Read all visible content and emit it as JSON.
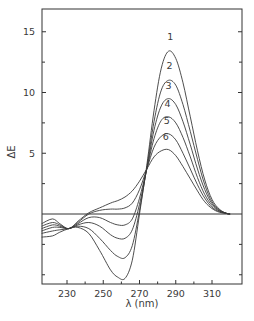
{
  "chart_data": {
    "type": "line",
    "title": "",
    "xlabel": "λ (nm)",
    "ylabel": "ΔE",
    "xlim": [
      216,
      326
    ],
    "ylim": [
      -6,
      17
    ],
    "x_ticks": [
      230,
      250,
      270,
      290,
      310
    ],
    "x_minor_ticks": [
      240,
      260,
      280,
      300
    ],
    "y_ticks": [
      5,
      10,
      15
    ],
    "y_minor_ticks": [
      -5,
      -2.5,
      2.5,
      7.5,
      12.5
    ],
    "grid": false,
    "legend": "inline numeric labels above peaks",
    "zero_line": true,
    "x": [
      216,
      222,
      226,
      231,
      236,
      242,
      248,
      254,
      258,
      262,
      266,
      270,
      274,
      278,
      282,
      286,
      290,
      294,
      298,
      302,
      306,
      310,
      314,
      318,
      320
    ],
    "series": [
      {
        "name": "1",
        "values": [
          -1.9,
          -1.8,
          -1.5,
          -1.2,
          -1.1,
          -1.6,
          -3.0,
          -4.6,
          -5.2,
          -5.3,
          -3.8,
          0.0,
          4.0,
          8.5,
          12.0,
          13.4,
          12.8,
          10.8,
          8.0,
          5.2,
          2.8,
          1.2,
          0.4,
          0.05,
          0.0
        ]
      },
      {
        "name": "2",
        "values": [
          -1.6,
          -1.4,
          -1.3,
          -1.2,
          -1.0,
          -1.2,
          -2.0,
          -3.0,
          -3.5,
          -3.6,
          -2.6,
          0.3,
          3.8,
          7.6,
          10.2,
          11.0,
          10.6,
          9.0,
          6.8,
          4.5,
          2.4,
          1.0,
          0.35,
          0.05,
          0.0
        ]
      },
      {
        "name": "3",
        "values": [
          -1.4,
          -1.1,
          -1.1,
          -1.2,
          -0.9,
          -0.7,
          -1.0,
          -1.7,
          -2.0,
          -2.0,
          -1.3,
          0.8,
          3.7,
          6.9,
          8.9,
          9.5,
          9.0,
          7.6,
          5.7,
          3.7,
          2.0,
          0.85,
          0.3,
          0.05,
          0.0
        ]
      },
      {
        "name": "4",
        "values": [
          -1.2,
          -0.9,
          -1.0,
          -1.2,
          -0.8,
          -0.3,
          -0.3,
          -0.7,
          -0.9,
          -0.9,
          -0.4,
          1.3,
          3.7,
          6.2,
          7.7,
          8.0,
          7.5,
          6.3,
          4.7,
          3.0,
          1.6,
          0.7,
          0.25,
          0.05,
          0.0
        ]
      },
      {
        "name": "5",
        "values": [
          -1.0,
          -0.7,
          -0.9,
          -1.2,
          -0.7,
          0.0,
          0.3,
          0.4,
          0.4,
          0.5,
          0.9,
          2.0,
          3.7,
          5.5,
          6.4,
          6.6,
          6.1,
          5.0,
          3.7,
          2.4,
          1.3,
          0.55,
          0.2,
          0.05,
          0.0
        ]
      },
      {
        "name": "6",
        "values": [
          -0.8,
          -0.4,
          -0.8,
          -1.2,
          -0.6,
          0.1,
          0.5,
          0.9,
          1.1,
          1.4,
          1.9,
          2.7,
          3.7,
          4.7,
          5.2,
          5.3,
          4.8,
          3.9,
          2.9,
          1.9,
          1.0,
          0.45,
          0.15,
          0.05,
          0.0
        ]
      }
    ],
    "peak_labels": [
      {
        "label": "1",
        "x": 287,
        "y": 14.3
      },
      {
        "label": "2",
        "x": 286.5,
        "y": 11.9
      },
      {
        "label": "3",
        "x": 286,
        "y": 10.3
      },
      {
        "label": "4",
        "x": 285.5,
        "y": 8.8
      },
      {
        "label": "5",
        "x": 285,
        "y": 7.4
      },
      {
        "label": "6",
        "x": 284.5,
        "y": 6.1
      }
    ]
  },
  "axes": {
    "xlabel": "λ (nm)",
    "ylabel": "ΔE",
    "x_tick_labels": [
      "230",
      "250",
      "270",
      "290",
      "310"
    ],
    "y_tick_labels": [
      "5",
      "10",
      "15"
    ]
  }
}
